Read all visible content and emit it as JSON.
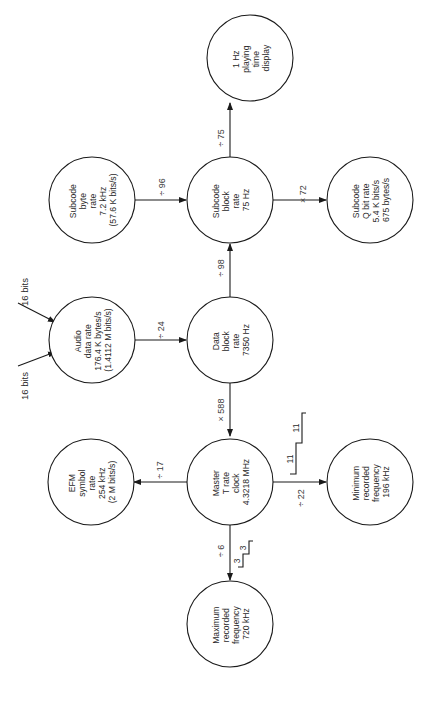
{
  "diagram": {
    "orientation": "rotated 90 degrees counter-clockwise",
    "nodes": {
      "playing_time": {
        "lines": [
          "1 Hz",
          "playing",
          "time",
          "display"
        ]
      },
      "subcode_block": {
        "lines": [
          "Subcode",
          "block",
          "rate",
          "75 Hz"
        ]
      },
      "subcode_q": {
        "lines": [
          "Subcode",
          "Q bit rate",
          "5.4 K bits/s",
          "675 bytes/s"
        ]
      },
      "subcode_byte": {
        "lines": [
          "Subcode",
          "byte",
          "rate",
          "7.2 kHz",
          "(57.6 K bits/s)"
        ]
      },
      "audio": {
        "lines": [
          "Audio",
          "data rate",
          "176.4 K bytes/s",
          "(1.4112 M bits/s)"
        ]
      },
      "data_block": {
        "lines": [
          "Data",
          "block",
          "rate",
          "7350 Hz"
        ]
      },
      "efm": {
        "lines": [
          "EFM",
          "symbol",
          "rate",
          "254 kHz",
          "(2 M bits/s)"
        ]
      },
      "master": {
        "lines": [
          "Master",
          "T rate",
          "clock",
          "4.3218 MHz"
        ]
      },
      "min_freq": {
        "lines": [
          "Minimum",
          "recorded",
          "frequency",
          "196 kHz"
        ]
      },
      "max_freq": {
        "lines": [
          "Maximum",
          "recorded",
          "frequency",
          "720 kHz"
        ]
      }
    },
    "edges": {
      "block_to_display": "÷ 75",
      "block_to_q": "× 72",
      "byte_to_block": "÷ 96",
      "data_to_block": "÷ 98",
      "audio_to_data": "÷ 24",
      "data_to_master": "× 588",
      "master_to_efm": "÷ 17",
      "master_to_min": "÷ 22",
      "master_to_max": "÷ 6"
    },
    "inputs": {
      "left": "16 bits",
      "right": "16 bits"
    },
    "waveforms": {
      "min_pulse": {
        "labels": [
          "11",
          "11"
        ]
      },
      "max_pulse": {
        "labels": [
          "3",
          "3"
        ]
      }
    }
  }
}
